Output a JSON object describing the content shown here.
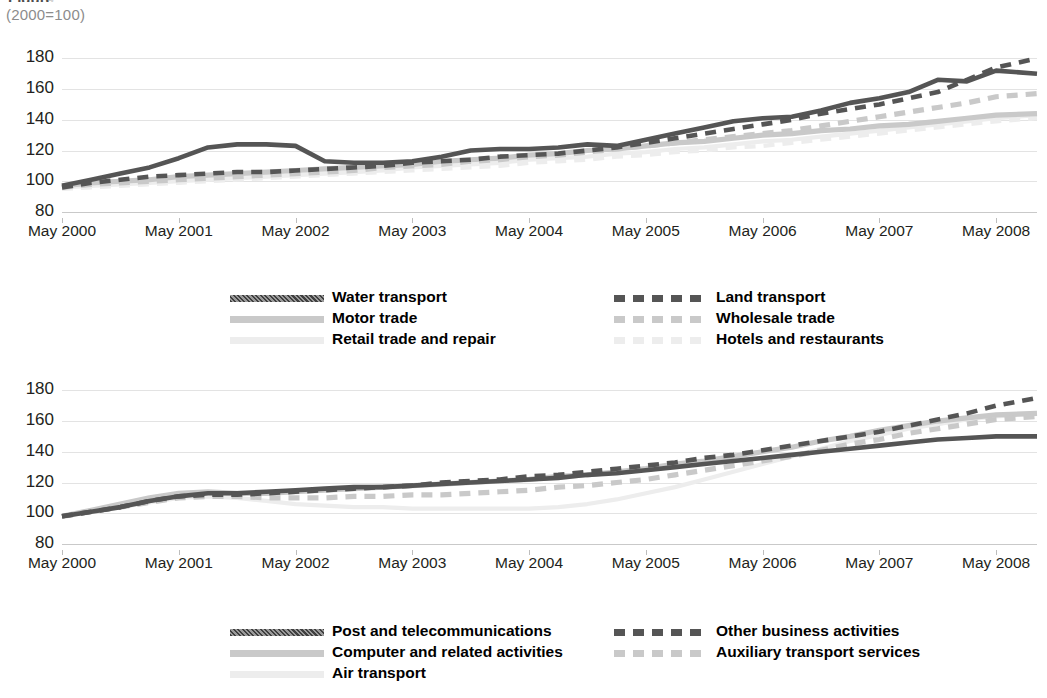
{
  "header": {
    "title_clipped": "Figure",
    "subtitle": "(2000=100)"
  },
  "axis": {
    "y_ticks": [
      "180",
      "160",
      "140",
      "120",
      "100",
      "80"
    ],
    "x_ticks": [
      "May  2000",
      "May  2001",
      "May  2002",
      "May  2003",
      "May  2004",
      "May  2005",
      "May  2006",
      "May  2007",
      "May  2008"
    ]
  },
  "colors": {
    "dark": "#555555",
    "mid": "#c9c9c9",
    "light": "#ededed",
    "grid": "#e3e3e3",
    "axis": "#c9c9c9",
    "text": "#231f20",
    "subtitle": "#8c8c8c"
  },
  "legend_top": {
    "left": [
      {
        "label": "Water transport",
        "style": "solid",
        "tone": "dark"
      },
      {
        "label": "Motor trade",
        "style": "solid",
        "tone": "mid"
      },
      {
        "label": "Retail trade and repair",
        "style": "solid",
        "tone": "light"
      }
    ],
    "right": [
      {
        "label": "Land transport",
        "style": "dashed",
        "tone": "dark"
      },
      {
        "label": "Wholesale trade",
        "style": "dashed",
        "tone": "mid"
      },
      {
        "label": "Hotels and restaurants",
        "style": "dashed",
        "tone": "light"
      }
    ]
  },
  "legend_bottom": {
    "left": [
      {
        "label": "Post and telecommunications",
        "style": "solid",
        "tone": "dark"
      },
      {
        "label": "Computer and related activities",
        "style": "solid",
        "tone": "mid"
      },
      {
        "label": "Air transport",
        "style": "solid",
        "tone": "light"
      }
    ],
    "right": [
      {
        "label": "Other business activities",
        "style": "dashed",
        "tone": "dark"
      },
      {
        "label": "Auxiliary transport services",
        "style": "dashed",
        "tone": "mid"
      }
    ]
  },
  "chart_data": [
    {
      "type": "line",
      "id": "top",
      "title": "",
      "xlabel": "",
      "ylabel": "(2000=100)",
      "ylim": [
        80,
        188
      ],
      "xlim": [
        2000.0,
        2008.35
      ],
      "grid": true,
      "legend_position": "below",
      "x": [
        2000.0,
        2000.25,
        2000.5,
        2000.75,
        2001.0,
        2001.25,
        2001.5,
        2001.75,
        2002.0,
        2002.25,
        2002.5,
        2002.75,
        2003.0,
        2003.25,
        2003.5,
        2003.75,
        2004.0,
        2004.25,
        2004.5,
        2004.75,
        2005.0,
        2005.25,
        2005.5,
        2005.75,
        2006.0,
        2006.25,
        2006.5,
        2006.75,
        2007.0,
        2007.25,
        2007.5,
        2007.75,
        2008.0,
        2008.35
      ],
      "series": [
        {
          "name": "Water transport",
          "style": "solid",
          "tone": "dark",
          "values": [
            97,
            101,
            105,
            109,
            115,
            122,
            124,
            124,
            123,
            113,
            112,
            112,
            113,
            116,
            120,
            121,
            121,
            122,
            124,
            123,
            127,
            131,
            135,
            139,
            141,
            142,
            146,
            151,
            154,
            158,
            166,
            165,
            172,
            170
          ]
        },
        {
          "name": "Land transport",
          "style": "dashed",
          "tone": "dark",
          "values": [
            96,
            99,
            101,
            103,
            104,
            105,
            106,
            106,
            107,
            108,
            109,
            110,
            112,
            113,
            114,
            116,
            117,
            118,
            120,
            122,
            125,
            128,
            131,
            134,
            137,
            140,
            144,
            147,
            150,
            154,
            158,
            166,
            174,
            180
          ]
        },
        {
          "name": "Motor trade",
          "style": "solid",
          "tone": "mid",
          "values": [
            97,
            99,
            100,
            101,
            103,
            104,
            105,
            106,
            107,
            108,
            109,
            110,
            111,
            113,
            114,
            115,
            117,
            118,
            120,
            121,
            123,
            125,
            126,
            128,
            130,
            131,
            133,
            134,
            136,
            137,
            139,
            141,
            143,
            144
          ]
        },
        {
          "name": "Wholesale trade",
          "style": "dashed",
          "tone": "mid",
          "values": [
            96,
            98,
            99,
            100,
            101,
            102,
            103,
            104,
            105,
            106,
            107,
            109,
            110,
            111,
            113,
            114,
            116,
            117,
            119,
            121,
            123,
            125,
            127,
            129,
            131,
            133,
            136,
            139,
            142,
            145,
            148,
            151,
            155,
            157
          ]
        },
        {
          "name": "Retail trade and repair",
          "style": "solid",
          "tone": "light",
          "values": [
            96,
            97,
            98,
            99,
            100,
            101,
            102,
            103,
            104,
            105,
            106,
            107,
            109,
            110,
            111,
            112,
            114,
            115,
            116,
            118,
            119,
            121,
            122,
            124,
            126,
            127,
            129,
            131,
            133,
            135,
            137,
            139,
            141,
            143
          ]
        },
        {
          "name": "Hotels and restaurants",
          "style": "dashed",
          "tone": "light",
          "values": [
            95,
            96,
            97,
            98,
            99,
            100,
            101,
            102,
            103,
            104,
            105,
            106,
            107,
            108,
            109,
            110,
            112,
            113,
            114,
            116,
            117,
            119,
            120,
            122,
            123,
            125,
            127,
            129,
            131,
            133,
            135,
            137,
            139,
            141
          ]
        }
      ]
    },
    {
      "type": "line",
      "id": "bottom",
      "title": "",
      "xlabel": "",
      "ylabel": "(2000=100)",
      "ylim": [
        80,
        188
      ],
      "xlim": [
        2000.0,
        2008.35
      ],
      "grid": true,
      "legend_position": "below",
      "x": [
        2000.0,
        2000.25,
        2000.5,
        2000.75,
        2001.0,
        2001.25,
        2001.5,
        2001.75,
        2002.0,
        2002.25,
        2002.5,
        2002.75,
        2003.0,
        2003.25,
        2003.5,
        2003.75,
        2004.0,
        2004.25,
        2004.5,
        2004.75,
        2005.0,
        2005.25,
        2005.5,
        2005.75,
        2006.0,
        2006.25,
        2006.5,
        2006.75,
        2007.0,
        2007.25,
        2007.5,
        2007.75,
        2008.0,
        2008.35
      ],
      "series": [
        {
          "name": "Post and telecommunications",
          "style": "solid",
          "tone": "dark",
          "values": [
            98,
            101,
            104,
            108,
            111,
            113,
            113,
            114,
            115,
            116,
            117,
            117,
            118,
            119,
            120,
            121,
            122,
            123,
            125,
            126,
            128,
            130,
            132,
            134,
            136,
            138,
            140,
            142,
            144,
            146,
            148,
            149,
            150,
            150
          ]
        },
        {
          "name": "Other business activities",
          "style": "dashed",
          "tone": "dark",
          "values": [
            98,
            101,
            104,
            108,
            111,
            112,
            112,
            113,
            114,
            115,
            116,
            117,
            118,
            120,
            121,
            122,
            124,
            125,
            127,
            129,
            131,
            133,
            136,
            138,
            141,
            144,
            147,
            150,
            153,
            157,
            161,
            165,
            170,
            175
          ]
        },
        {
          "name": "Computer and related activities",
          "style": "solid",
          "tone": "mid",
          "values": [
            98,
            102,
            106,
            110,
            113,
            114,
            113,
            113,
            114,
            115,
            116,
            117,
            118,
            119,
            120,
            121,
            122,
            124,
            125,
            127,
            129,
            132,
            134,
            137,
            140,
            143,
            147,
            150,
            154,
            157,
            160,
            162,
            164,
            165
          ]
        },
        {
          "name": "Auxiliary transport services",
          "style": "dashed",
          "tone": "mid",
          "values": [
            98,
            101,
            104,
            107,
            110,
            111,
            111,
            110,
            110,
            110,
            111,
            111,
            112,
            112,
            113,
            114,
            115,
            117,
            118,
            120,
            122,
            125,
            128,
            131,
            134,
            137,
            141,
            145,
            148,
            152,
            155,
            158,
            161,
            163
          ]
        },
        {
          "name": "Air transport",
          "style": "solid",
          "tone": "light",
          "values": [
            98,
            101,
            104,
            107,
            110,
            111,
            110,
            108,
            106,
            105,
            104,
            104,
            103,
            103,
            103,
            103,
            103,
            104,
            106,
            109,
            113,
            117,
            122,
            127,
            132,
            137,
            142,
            147,
            151,
            155,
            158,
            161,
            163,
            165
          ]
        }
      ]
    }
  ]
}
